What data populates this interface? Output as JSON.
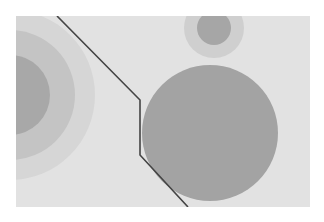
{
  "image": {
    "width": 324,
    "height": 222,
    "background": "#ffffff",
    "panel": {
      "x": 16,
      "y": 16,
      "width": 294,
      "height": 191,
      "fill": "#e2e2e2"
    },
    "target_groups": [
      {
        "name": "left-concentric-circles",
        "cx": 10,
        "cy": 95,
        "rings": [
          {
            "r": 85,
            "fill": "#d6d6d6"
          },
          {
            "r": 65,
            "fill": "#c4c4c4"
          },
          {
            "r": 40,
            "fill": "#a8a8a8"
          }
        ]
      },
      {
        "name": "top-right-target",
        "cx": 214,
        "cy": 28,
        "rings": [
          {
            "r": 30,
            "fill": "#cfcfcf"
          },
          {
            "r": 17,
            "fill": "#a6a6a6"
          }
        ]
      }
    ],
    "large_circle": {
      "cx": 210,
      "cy": 133,
      "r": 68,
      "fill": "#a3a3a3"
    },
    "polyline": {
      "points": "57,16 140,100 140,155 188,207",
      "stroke": "#444444",
      "stroke_width": 1.6
    }
  }
}
